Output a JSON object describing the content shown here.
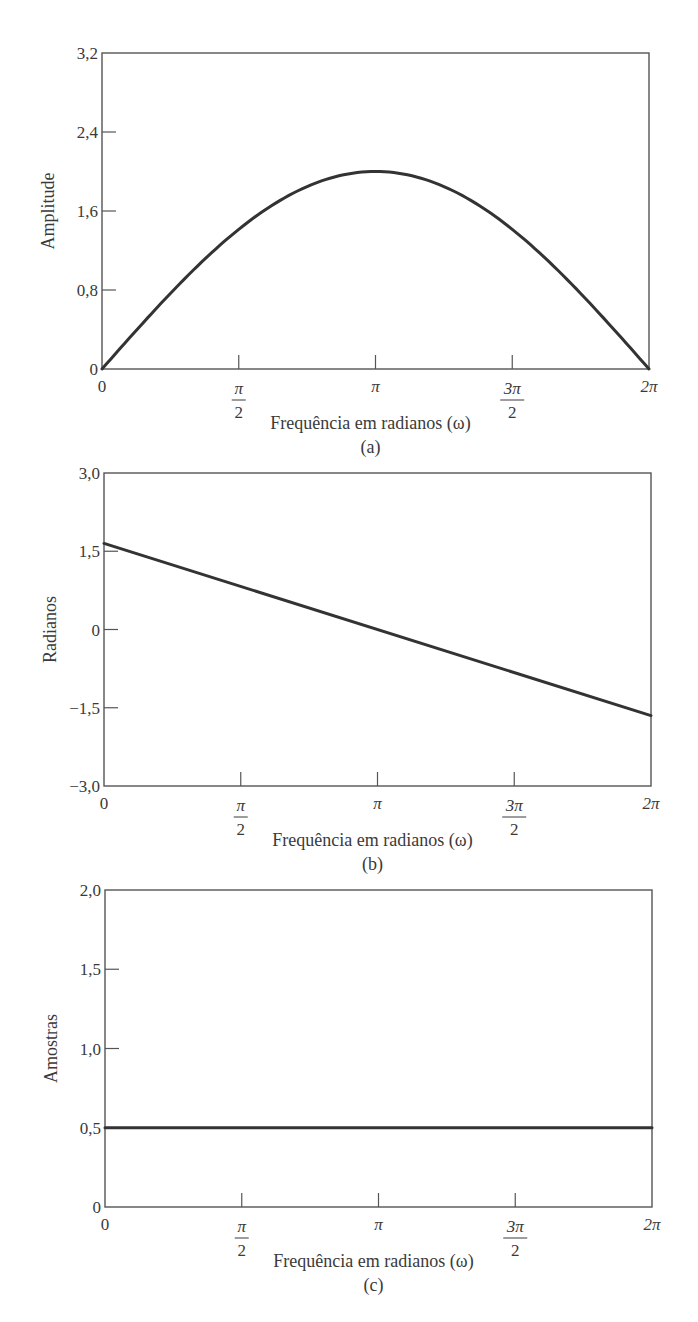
{
  "chart_data": [
    {
      "id": "a",
      "type": "line",
      "caption": "(a)",
      "xlabel": "Frequência em radianos (ω)",
      "ylabel": "Amplitude",
      "xlim": [
        0,
        6.2832
      ],
      "ylim": [
        0,
        3.2
      ],
      "x_ticks": [
        "0",
        "π/2",
        "π",
        "3π/2",
        "2π"
      ],
      "y_ticks": [
        "0",
        "0,8",
        "1,6",
        "2,4",
        "3,2"
      ],
      "y_tick_values": [
        0,
        0.8,
        1.6,
        2.4,
        3.2
      ],
      "series": [
        {
          "name": "|H(ω)| = 2 sin(ω/2)",
          "x": [
            0,
            0.7854,
            1.5708,
            2.3562,
            3.1416,
            3.927,
            4.7124,
            5.4978,
            6.2832
          ],
          "values": [
            0,
            0.765,
            1.414,
            1.848,
            2.0,
            1.848,
            1.414,
            0.765,
            0
          ]
        }
      ],
      "grid": false,
      "frame": {
        "left": 102,
        "top": 53,
        "right": 649,
        "bottom": 369
      }
    },
    {
      "id": "b",
      "type": "line",
      "caption": "(b)",
      "xlabel": "Frequência em radianos (ω)",
      "ylabel": "Radianos",
      "xlim": [
        0,
        6.2832
      ],
      "ylim": [
        -3.0,
        3.0
      ],
      "x_ticks": [
        "0",
        "π/2",
        "π",
        "3π/2",
        "2π"
      ],
      "y_ticks": [
        "−3,0",
        "−1,5",
        "0",
        "1,5",
        "3,0"
      ],
      "y_tick_values": [
        -3.0,
        -1.5,
        0,
        1.5,
        3.0
      ],
      "series": [
        {
          "name": "fase",
          "x": [
            0,
            6.2832
          ],
          "values": [
            1.65,
            -1.65
          ]
        }
      ],
      "grid": false,
      "frame": {
        "left": 104,
        "top": 473,
        "right": 651,
        "bottom": 786
      }
    },
    {
      "id": "c",
      "type": "line",
      "caption": "(c)",
      "xlabel": "Frequência em radianos (ω)",
      "ylabel": "Amostras",
      "xlim": [
        0,
        6.2832
      ],
      "ylim": [
        0,
        2.0
      ],
      "x_ticks": [
        "0",
        "π/2",
        "π",
        "3π/2",
        "2π"
      ],
      "y_ticks": [
        "0",
        "0,5",
        "1,0",
        "1,5",
        "2,0"
      ],
      "y_tick_values": [
        0,
        0.5,
        1.0,
        1.5,
        2.0
      ],
      "series": [
        {
          "name": "atraso de grupo",
          "x": [
            0,
            6.2832
          ],
          "values": [
            0.5,
            0.5
          ]
        }
      ],
      "grid": false,
      "frame": {
        "left": 105,
        "top": 890,
        "right": 652,
        "bottom": 1207
      }
    }
  ],
  "colors": {
    "line": "#333333",
    "frame": "#555555",
    "text": "#3a3a3a"
  }
}
